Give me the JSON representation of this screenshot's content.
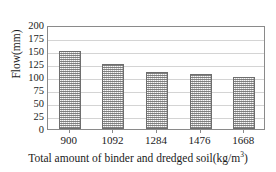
{
  "chart_data": {
    "type": "bar",
    "title": "",
    "categories": [
      "900",
      "1092",
      "1284",
      "1476",
      "1668"
    ],
    "values": [
      150,
      125,
      110,
      105,
      100
    ],
    "series": [
      {
        "name": "Flow",
        "values": [
          150,
          125,
          110,
          105,
          100
        ]
      }
    ],
    "xlabel": "Total amount of binder and dredged soil(kg/m",
    "xlabel_superscript": "3",
    "xlabel_suffix": ")",
    "ylabel": "Flow(mm)",
    "ylim": [
      0,
      200
    ],
    "ytick_labels": [
      "0",
      "25",
      "50",
      "75",
      "100",
      "125",
      "150",
      "175",
      "200"
    ],
    "ytick_values": [
      0,
      25,
      50,
      75,
      100,
      125,
      150,
      175,
      200
    ],
    "grid": true,
    "grid_axis": "y",
    "legend": null,
    "bar_fill_color": "#c9c9c9",
    "bar_edge_color": "#6e6e6e",
    "gridline_color": "#d4d4d4",
    "axis_color": "#8a8a8a",
    "background_color": "#ffffff"
  }
}
